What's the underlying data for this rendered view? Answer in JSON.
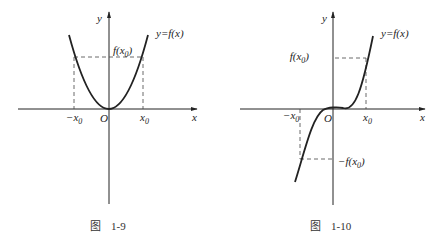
{
  "figures": [
    {
      "id": "fig-1-9",
      "caption": {
        "prefix": "图",
        "number": "1-9"
      },
      "axis_labels": {
        "x": "x",
        "y": "y",
        "origin": "O"
      },
      "curve_label": "y=f(x)",
      "fx0_label": "f(x",
      "fx0_sub": "0",
      "fx0_close": ")",
      "neg_x0_label": "−x",
      "neg_x0_sub": "0",
      "x0_label": "x",
      "x0_sub": "0",
      "description": "Even function (parabola) symmetric about y-axis"
    },
    {
      "id": "fig-1-10",
      "caption": {
        "prefix": "图",
        "number": "1-10"
      },
      "axis_labels": {
        "x": "x",
        "y": "y",
        "origin": "O"
      },
      "curve_label": "y=f(x)",
      "fx0_label": "f(x",
      "fx0_sub": "0",
      "fx0_close": ")",
      "neg_fx0_label": "−f(x",
      "neg_fx0_sub": "0",
      "neg_fx0_close": ")",
      "neg_x0_label": "−x",
      "neg_x0_sub": "0",
      "x0_label": "x",
      "x0_sub": "0",
      "description": "Odd function (cubic-like) symmetric about origin"
    }
  ],
  "colors": {
    "stroke": "#222222",
    "dash": "#444444"
  }
}
